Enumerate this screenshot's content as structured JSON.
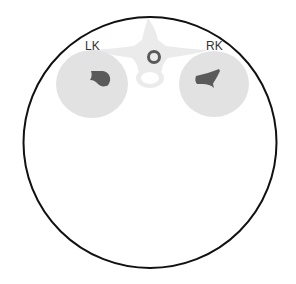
{
  "diagram": {
    "type": "axial-ct-schematic",
    "labels": {
      "left_kidney": "LK",
      "right_kidney": "RK"
    },
    "colors": {
      "background": "#ffffff",
      "body_outline": "#111111",
      "kidney_parenchyma": "#e2e2e2",
      "renal_sinus": "#5a5a5a",
      "vertebra": "#ebebeb",
      "spinal_canal_ring": "#5a5a5a",
      "label_text": "#333333"
    }
  }
}
